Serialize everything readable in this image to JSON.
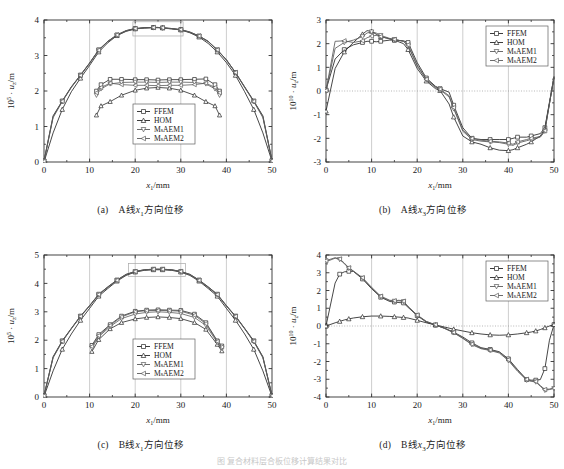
{
  "figure": {
    "bottom_caption": "图  复合材料层合板位移计算结果对比",
    "panels": [
      {
        "key": "a",
        "caption_label": "(a)",
        "caption_text_pre": "A线",
        "caption_var": "x",
        "caption_var_sub": "1",
        "caption_text_post": "方向位移"
      },
      {
        "key": "b",
        "caption_label": "(b)",
        "caption_text_pre": "A线",
        "caption_var": "x",
        "caption_var_sub": "3",
        "caption_text_post": "方向位移"
      },
      {
        "key": "c",
        "caption_label": "(c)",
        "caption_text_pre": "B线",
        "caption_var": "x",
        "caption_var_sub": "1",
        "caption_text_post": "方向位移"
      },
      {
        "key": "d",
        "caption_label": "(d)",
        "caption_text_pre": "B线",
        "caption_var": "x",
        "caption_var_sub": "3",
        "caption_text_post": "方向位移"
      }
    ]
  },
  "legend": {
    "entries": [
      {
        "label": "FFEM",
        "marker": "square",
        "color": "#262626"
      },
      {
        "label": "HOM",
        "marker": "triangle",
        "color": "#262626"
      },
      {
        "label": "MsAEM1",
        "marker": "dtriangle",
        "color": "#5a5a5a"
      },
      {
        "label": "MsAEM2",
        "marker": "ltriangle",
        "color": "#5a5a5a"
      }
    ]
  },
  "chart_data": [
    {
      "type": "line",
      "panel": "a",
      "title": "(a) A线x1方向位移",
      "xlabel": "x1/mm",
      "ylabel": "10^5 · uz/m",
      "y_exponent": "5",
      "y_var": "u",
      "y_var_sub": "z",
      "xlim": [
        0,
        50
      ],
      "ylim": [
        0,
        4
      ],
      "xticks": [
        0,
        10,
        20,
        30,
        40,
        50
      ],
      "yticks": [
        0,
        1,
        2,
        3,
        4
      ],
      "grid": "vertical-major",
      "legend_position": "lower-center",
      "zero_line": false,
      "inset_box": {
        "x0": 19.5,
        "x1": 30.5,
        "y0": 3.55,
        "y1": 3.95
      },
      "x": [
        0,
        2,
        4,
        6,
        8,
        10,
        12,
        14,
        16,
        18,
        20,
        22,
        24,
        25,
        26,
        28,
        30,
        32,
        34,
        36,
        38,
        40,
        42,
        44,
        46,
        48,
        50
      ],
      "series": [
        {
          "name": "FFEM",
          "values": [
            0.03,
            1.3,
            1.72,
            2.12,
            2.45,
            2.79,
            3.16,
            3.4,
            3.58,
            3.7,
            3.76,
            3.78,
            3.79,
            3.79,
            3.78,
            3.76,
            3.73,
            3.66,
            3.55,
            3.4,
            3.16,
            2.88,
            2.52,
            2.12,
            1.72,
            1.3,
            0.04
          ]
        },
        {
          "name": "HOM",
          "values": [
            0.0,
            0.82,
            1.48,
            1.98,
            2.36,
            2.72,
            3.1,
            3.36,
            3.56,
            3.68,
            3.75,
            3.78,
            3.79,
            3.79,
            3.78,
            3.75,
            3.72,
            3.64,
            3.52,
            3.34,
            3.1,
            2.8,
            2.44,
            1.98,
            1.48,
            0.82,
            0.02
          ]
        },
        {
          "name": "MsAEM1",
          "values": [
            0.02,
            1.25,
            1.7,
            2.1,
            2.44,
            2.78,
            3.15,
            3.39,
            3.57,
            3.69,
            3.75,
            3.77,
            3.78,
            3.78,
            3.77,
            3.75,
            3.72,
            3.65,
            3.54,
            3.39,
            3.15,
            2.87,
            2.51,
            2.1,
            1.7,
            1.25,
            0.03
          ]
        },
        {
          "name": "MsAEM2",
          "values": [
            0.02,
            1.28,
            1.71,
            2.11,
            2.44,
            2.78,
            3.15,
            3.4,
            3.58,
            3.7,
            3.76,
            3.78,
            3.79,
            3.79,
            3.78,
            3.76,
            3.73,
            3.66,
            3.55,
            3.4,
            3.16,
            2.88,
            2.52,
            2.11,
            1.71,
            1.28,
            0.03
          ]
        }
      ],
      "inset_detail": {
        "x": [
          11.5,
          12.5,
          14.5,
          17,
          20,
          22.5,
          25,
          27.5,
          30,
          33,
          35.5,
          37.5,
          38.5
        ],
        "series": [
          {
            "name": "FFEM",
            "values": [
              2.0,
              2.18,
              2.33,
              2.33,
              2.32,
              2.32,
              2.31,
              2.32,
              2.32,
              2.33,
              2.34,
              2.18,
              2.0
            ]
          },
          {
            "name": "HOM",
            "values": [
              1.32,
              1.58,
              1.7,
              1.88,
              2.02,
              2.08,
              2.1,
              2.08,
              2.02,
              1.88,
              1.7,
              1.58,
              1.32
            ]
          },
          {
            "name": "MsAEM1",
            "values": [
              1.88,
              2.06,
              2.2,
              2.24,
              2.25,
              2.25,
              2.24,
              2.25,
              2.25,
              2.24,
              2.2,
              2.06,
              1.88
            ]
          },
          {
            "name": "MsAEM2",
            "values": [
              1.95,
              2.1,
              2.22,
              2.18,
              2.16,
              2.16,
              2.15,
              2.16,
              2.16,
              2.18,
              2.22,
              2.1,
              1.95
            ]
          }
        ]
      }
    },
    {
      "type": "line",
      "panel": "b",
      "title": "(b) A线x3方向位移",
      "xlabel": "x1/mm",
      "ylabel": "10^10 · uz/m",
      "y_exponent": "10",
      "y_var": "u",
      "y_var_sub": "z",
      "xlim": [
        0,
        50
      ],
      "ylim": [
        -3,
        3
      ],
      "xticks": [
        0,
        10,
        20,
        30,
        40,
        50
      ],
      "yticks": [
        -3,
        -2,
        -1,
        0,
        1,
        2,
        3
      ],
      "grid": "vertical-major",
      "legend_position": "upper-right",
      "zero_line": true,
      "x": [
        0,
        2,
        4,
        6,
        8,
        9,
        10,
        11,
        12,
        14,
        15,
        17,
        18,
        20,
        22,
        24,
        25,
        27,
        28,
        30,
        32,
        34,
        36,
        38,
        40,
        41,
        42,
        44,
        45,
        47,
        48,
        50
      ],
      "series": [
        {
          "name": "FFEM",
          "values": [
            0.05,
            1.35,
            1.75,
            1.95,
            2.05,
            2.1,
            2.1,
            2.08,
            2.1,
            2.15,
            2.15,
            2.12,
            2.05,
            1.2,
            0.55,
            0.2,
            0.1,
            -0.05,
            -0.6,
            -1.55,
            -2.0,
            -2.05,
            -2.05,
            -2.05,
            -2.05,
            -2.0,
            -1.95,
            -1.95,
            -1.9,
            -1.8,
            -1.55,
            0.6
          ]
        },
        {
          "name": "HOM",
          "values": [
            -0.85,
            0.95,
            1.65,
            2.05,
            2.4,
            2.55,
            2.52,
            2.4,
            2.3,
            2.2,
            2.15,
            2.0,
            1.75,
            0.95,
            0.42,
            0.1,
            0.02,
            -0.55,
            -1.1,
            -1.9,
            -2.15,
            -2.25,
            -2.4,
            -2.5,
            -2.52,
            -2.48,
            -2.4,
            -2.25,
            -2.15,
            -1.9,
            -1.6,
            0.55
          ]
        },
        {
          "name": "MsAEM1",
          "values": [
            0.0,
            1.8,
            2.05,
            2.15,
            2.3,
            2.45,
            2.5,
            2.45,
            2.35,
            2.22,
            2.18,
            2.1,
            1.9,
            1.05,
            0.48,
            0.15,
            0.05,
            -0.25,
            -0.75,
            -1.7,
            -2.05,
            -2.12,
            -2.15,
            -2.18,
            -2.25,
            -2.3,
            -2.2,
            -2.1,
            -2.05,
            -1.95,
            -1.7,
            0.62
          ]
        },
        {
          "name": "MsAEM2",
          "values": [
            0.02,
            2.1,
            2.12,
            2.05,
            2.12,
            2.25,
            2.32,
            2.35,
            2.3,
            2.2,
            2.18,
            2.1,
            1.95,
            1.1,
            0.5,
            0.18,
            0.08,
            -0.2,
            -0.7,
            -1.65,
            -2.0,
            -2.08,
            -2.12,
            -2.15,
            -2.2,
            -2.25,
            -2.15,
            -2.05,
            -2.0,
            -1.92,
            -1.68,
            0.6
          ]
        }
      ]
    },
    {
      "type": "line",
      "panel": "c",
      "title": "(c) B线x1方向位移",
      "xlabel": "x1/mm",
      "ylabel": "10^5 · uz/m",
      "y_exponent": "5",
      "y_var": "u",
      "y_var_sub": "z",
      "xlim": [
        0,
        50
      ],
      "ylim": [
        0,
        5
      ],
      "xticks": [
        0,
        10,
        20,
        30,
        40,
        50
      ],
      "yticks": [
        0,
        1,
        2,
        3,
        4,
        5
      ],
      "grid": "vertical-major",
      "legend_position": "lower-center",
      "zero_line": false,
      "inset_box": {
        "x0": 18.5,
        "x1": 31.0,
        "y0": 4.25,
        "y1": 4.7
      },
      "x": [
        0,
        2,
        4,
        6,
        8,
        10,
        12,
        14,
        16,
        18,
        20,
        22,
        24,
        25,
        26,
        28,
        30,
        32,
        34,
        36,
        38,
        40,
        42,
        44,
        46,
        48,
        50
      ],
      "series": [
        {
          "name": "FFEM",
          "values": [
            0.05,
            1.42,
            1.98,
            2.42,
            2.85,
            3.22,
            3.62,
            3.88,
            4.12,
            4.32,
            4.42,
            4.48,
            4.5,
            4.5,
            4.5,
            4.48,
            4.42,
            4.32,
            4.12,
            3.88,
            3.62,
            3.22,
            2.85,
            2.42,
            1.98,
            1.42,
            0.05
          ]
        },
        {
          "name": "HOM",
          "values": [
            0.02,
            0.92,
            1.68,
            2.22,
            2.7,
            3.12,
            3.55,
            3.82,
            4.08,
            4.28,
            4.4,
            4.46,
            4.48,
            4.48,
            4.48,
            4.46,
            4.4,
            4.28,
            4.08,
            3.82,
            3.55,
            3.12,
            2.7,
            2.22,
            1.68,
            0.92,
            0.02
          ]
        },
        {
          "name": "MsAEM1",
          "values": [
            0.04,
            1.38,
            1.95,
            2.4,
            2.83,
            3.2,
            3.6,
            3.86,
            4.1,
            4.3,
            4.41,
            4.47,
            4.49,
            4.49,
            4.49,
            4.47,
            4.41,
            4.3,
            4.1,
            3.86,
            3.6,
            3.2,
            2.83,
            2.4,
            1.95,
            1.38,
            0.04
          ]
        },
        {
          "name": "MsAEM2",
          "values": [
            0.04,
            1.4,
            1.96,
            2.41,
            2.84,
            3.21,
            3.61,
            3.87,
            4.11,
            4.31,
            4.42,
            4.48,
            4.5,
            4.5,
            4.5,
            4.48,
            4.42,
            4.31,
            4.11,
            3.87,
            3.61,
            3.21,
            2.84,
            2.41,
            1.96,
            1.4,
            0.04
          ]
        }
      ],
      "inset_detail": {
        "x": [
          10.5,
          12,
          14.5,
          17,
          20,
          22.5,
          25,
          27.5,
          30,
          33,
          35.5,
          38,
          39
        ],
        "series": [
          {
            "name": "FFEM",
            "values": [
              1.82,
              2.2,
              2.55,
              2.85,
              3.02,
              3.06,
              3.07,
              3.06,
              3.05,
              2.92,
              2.62,
              1.98,
              1.8
            ]
          },
          {
            "name": "HOM",
            "values": [
              1.6,
              2.02,
              2.4,
              2.62,
              2.75,
              2.8,
              2.82,
              2.8,
              2.76,
              2.62,
              2.38,
              1.85,
              1.62
            ]
          },
          {
            "name": "MsAEM1",
            "values": [
              1.72,
              2.12,
              2.48,
              2.76,
              2.92,
              2.98,
              3.0,
              2.98,
              2.94,
              2.8,
              2.52,
              1.92,
              1.72
            ]
          },
          {
            "name": "MsAEM2",
            "values": [
              1.78,
              2.16,
              2.52,
              2.82,
              3.0,
              3.04,
              3.05,
              3.04,
              3.02,
              2.88,
              2.58,
              1.96,
              1.76
            ]
          }
        ]
      }
    },
    {
      "type": "line",
      "panel": "d",
      "title": "(d) B线x3方向位移",
      "xlabel": "x1/mm",
      "ylabel": "10^10 · uz/m",
      "y_exponent": "10",
      "y_var": "u",
      "y_var_sub": "z",
      "xlim": [
        0,
        50
      ],
      "ylim": [
        -4,
        4
      ],
      "xticks": [
        0,
        10,
        20,
        30,
        40,
        50
      ],
      "yticks": [
        -4,
        -3,
        -2,
        -1,
        0,
        1,
        2,
        3,
        4
      ],
      "grid": "vertical-major",
      "legend_position": "upper-right",
      "zero_line": true,
      "x": [
        0,
        2,
        3,
        4,
        5,
        6,
        8,
        10,
        12,
        14,
        15,
        16,
        17,
        18,
        20,
        22,
        24,
        26,
        28,
        30,
        32,
        34,
        36,
        38,
        40,
        42,
        44,
        45,
        46,
        47,
        48,
        49,
        50
      ],
      "series": [
        {
          "name": "FFEM",
          "values": [
            0.0,
            2.42,
            2.92,
            3.05,
            3.08,
            3.08,
            2.65,
            2.1,
            1.62,
            1.38,
            1.35,
            1.32,
            1.3,
            1.05,
            0.58,
            0.22,
            0.05,
            -0.12,
            -0.35,
            -0.62,
            -0.95,
            -1.22,
            -1.32,
            -1.45,
            -1.85,
            -2.45,
            -3.02,
            -3.05,
            -3.05,
            -3.02,
            -2.4,
            -0.8,
            0.08
          ]
        },
        {
          "name": "HOM",
          "values": [
            0.0,
            0.18,
            0.26,
            0.34,
            0.4,
            0.45,
            0.52,
            0.56,
            0.56,
            0.54,
            0.52,
            0.5,
            0.48,
            0.45,
            0.32,
            0.18,
            0.06,
            -0.06,
            -0.18,
            -0.28,
            -0.38,
            -0.45,
            -0.5,
            -0.52,
            -0.5,
            -0.45,
            -0.38,
            -0.34,
            -0.28,
            -0.2,
            -0.1,
            0.0,
            0.08
          ]
        },
        {
          "name": "MsAEM1",
          "values": [
            3.62,
            3.82,
            3.75,
            3.52,
            3.25,
            3.08,
            2.7,
            2.15,
            1.65,
            1.42,
            1.4,
            1.42,
            1.38,
            1.08,
            0.6,
            0.25,
            0.06,
            -0.14,
            -0.38,
            -0.7,
            -1.05,
            -1.28,
            -1.38,
            -1.52,
            -1.95,
            -2.55,
            -3.05,
            -3.12,
            -3.15,
            -3.4,
            -3.62,
            -3.58,
            -3.52
          ]
        },
        {
          "name": "MsAEM2",
          "values": [
            3.68,
            3.85,
            3.78,
            3.55,
            3.28,
            3.1,
            2.72,
            2.18,
            1.68,
            1.45,
            1.42,
            1.45,
            1.4,
            1.1,
            0.62,
            0.26,
            0.07,
            -0.13,
            -0.36,
            -0.68,
            -1.02,
            -1.25,
            -1.35,
            -1.48,
            -1.9,
            -2.5,
            -3.0,
            -3.08,
            -3.12,
            -3.35,
            -3.58,
            -3.55,
            -3.5
          ]
        }
      ]
    }
  ]
}
